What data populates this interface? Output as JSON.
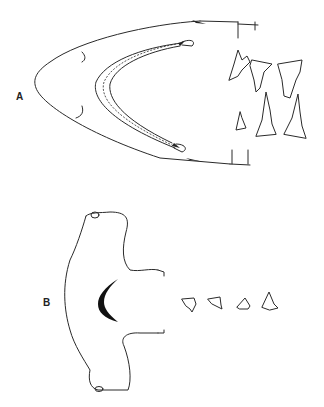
{
  "figure": {
    "panels": [
      {
        "id": "A",
        "label": "A",
        "subject": "shark head ventral view with mouth and teeth",
        "teeth_count": 6
      },
      {
        "id": "B",
        "label": "B",
        "subject": "hammerhead shark head ventral view with mouth and teeth",
        "teeth_count": 4
      }
    ]
  }
}
